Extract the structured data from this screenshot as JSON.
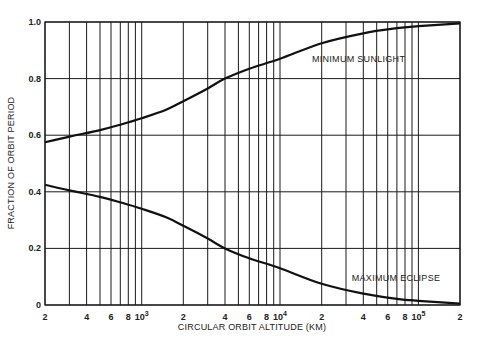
{
  "chart_data": {
    "type": "line",
    "title": "",
    "xlabel": "CIRCULAR ORBIT ALTITUDE (KM)",
    "ylabel": "FRACTION OF ORBIT PERIOD",
    "xscale": "log",
    "xlim": [
      200,
      200000
    ],
    "ylim": [
      0,
      1.0
    ],
    "grid": true,
    "legend": "none (inline curve annotations)",
    "x_tick_labels": [
      {
        "value": 200,
        "label": "2"
      },
      {
        "value": 400,
        "label": "4"
      },
      {
        "value": 600,
        "label": "6"
      },
      {
        "value": 800,
        "label": "8"
      },
      {
        "value": 1000,
        "label": "10",
        "sup": "3"
      },
      {
        "value": 2000,
        "label": "2"
      },
      {
        "value": 4000,
        "label": "4"
      },
      {
        "value": 6000,
        "label": "6"
      },
      {
        "value": 8000,
        "label": "8"
      },
      {
        "value": 10000,
        "label": "10",
        "sup": "4"
      },
      {
        "value": 20000,
        "label": "2"
      },
      {
        "value": 40000,
        "label": "4"
      },
      {
        "value": 60000,
        "label": "6"
      },
      {
        "value": 80000,
        "label": "8"
      },
      {
        "value": 100000,
        "label": "10",
        "sup": "5"
      },
      {
        "value": 200000,
        "label": "2"
      }
    ],
    "x_gridlines": [
      200,
      300,
      400,
      500,
      600,
      700,
      800,
      900,
      1000,
      2000,
      3000,
      4000,
      5000,
      6000,
      7000,
      8000,
      9000,
      10000,
      20000,
      30000,
      40000,
      50000,
      60000,
      70000,
      80000,
      90000,
      100000,
      200000
    ],
    "y_ticks": [
      0,
      0.2,
      0.4,
      0.6,
      0.8,
      1.0
    ],
    "y_tick_labels": [
      "0",
      "0.2",
      "0.4",
      "0.6",
      "0.8",
      "1.0"
    ],
    "x": [
      200,
      300,
      500,
      700,
      1000,
      1500,
      2000,
      3000,
      4000,
      6000,
      10000,
      20000,
      40000,
      70000,
      100000,
      200000
    ],
    "series": [
      {
        "name": "MINIMUM SUNLIGHT",
        "values": [
          0.575,
          0.595,
          0.618,
          0.637,
          0.66,
          0.69,
          0.72,
          0.765,
          0.8,
          0.835,
          0.87,
          0.925,
          0.96,
          0.978,
          0.985,
          0.995
        ]
      },
      {
        "name": "MAXIMUM ECLIPSE",
        "values": [
          0.425,
          0.405,
          0.382,
          0.363,
          0.34,
          0.31,
          0.28,
          0.235,
          0.2,
          0.165,
          0.13,
          0.075,
          0.04,
          0.022,
          0.015,
          0.005
        ]
      }
    ],
    "annotations": [
      {
        "text": "MINIMUM SUNLIGHT",
        "x": 17000,
        "y": 0.86
      },
      {
        "text": "MAXIMUM ECLIPSE",
        "x": 33000,
        "y": 0.085
      }
    ]
  },
  "labels": {
    "xlabel": "CIRCULAR ORBIT ALTITUDE (KM)",
    "ylabel": "FRACTION OF ORBIT PERIOD",
    "annot_sunlight": "MINIMUM SUNLIGHT",
    "annot_eclipse": "MAXIMUM ECLIPSE"
  }
}
